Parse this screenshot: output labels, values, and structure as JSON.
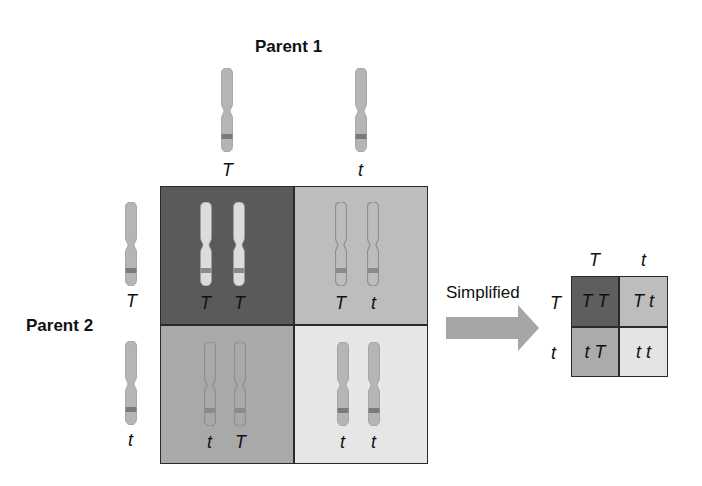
{
  "parent1": {
    "title": "Parent 1",
    "alleles": [
      "T",
      "t"
    ]
  },
  "parent2": {
    "title": "Parent 2",
    "alleles": [
      "T",
      "t"
    ]
  },
  "punnett_square": {
    "cells": [
      {
        "row": 0,
        "col": 0,
        "left": "T",
        "right": "T",
        "color": "#5a5a5a",
        "outlined": false
      },
      {
        "row": 0,
        "col": 1,
        "left": "T",
        "right": "t",
        "color": "#bdbdbd",
        "outlined": true
      },
      {
        "row": 1,
        "col": 0,
        "left": "t",
        "right": "T",
        "color": "#a9a9a9",
        "outlined": true
      },
      {
        "row": 1,
        "col": 1,
        "left": "t",
        "right": "t",
        "color": "#e6e6e6",
        "outlined": false
      }
    ]
  },
  "arrow": {
    "label": "Simplified",
    "color": "#a6a6a6"
  },
  "simplified_square": {
    "col_headers": [
      "T",
      "t"
    ],
    "row_headers": [
      "T",
      "t"
    ],
    "cells": [
      {
        "text": "T T",
        "color": "#5e5e5e"
      },
      {
        "text": "T t",
        "color": "#bdbdbd"
      },
      {
        "text": "t T",
        "color": "#ababab"
      },
      {
        "text": "t t",
        "color": "#e4e4e4"
      }
    ]
  },
  "colors": {
    "chromosome_fill": "#b5b5b5",
    "chromosome_light": "#d8d8d8",
    "chromosome_band": "#7a7a7a",
    "grid_border": "#2a2a2a"
  }
}
